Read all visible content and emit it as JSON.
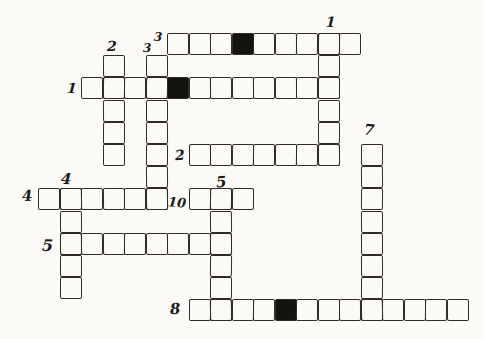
{
  "puzzle": {
    "paper_color": "#fbfaf7",
    "ink_color": "#2e2b28",
    "black_cell_color": "#141312",
    "label_color": "#1c1a17",
    "grid": {
      "origin_x": 38,
      "origin_y": 33,
      "cell_width": 21.5,
      "cell_height": 22.2,
      "columns": 20,
      "rows": 13
    },
    "words": [
      {
        "id": "3-across",
        "number": "3",
        "dir": "across",
        "row": 0,
        "col": 6,
        "len": 9,
        "black": [
          3
        ]
      },
      {
        "id": "1-across",
        "number": "1",
        "dir": "across",
        "row": 2,
        "col": 2,
        "len": 12,
        "black": [
          4
        ]
      },
      {
        "id": "2-across",
        "number": "2",
        "dir": "across",
        "row": 5,
        "col": 7,
        "len": 7,
        "black": []
      },
      {
        "id": "4-across",
        "number": "4",
        "dir": "across",
        "row": 7,
        "col": 0,
        "len": 6,
        "black": []
      },
      {
        "id": "10-across",
        "number": "10",
        "dir": "across",
        "row": 7,
        "col": 7,
        "len": 3,
        "black": []
      },
      {
        "id": "5-across",
        "number": "5",
        "dir": "across",
        "row": 9,
        "col": 1,
        "len": 8,
        "black": []
      },
      {
        "id": "8-across",
        "number": "8",
        "dir": "across",
        "row": 12,
        "col": 7,
        "len": 13,
        "black": [
          4
        ]
      },
      {
        "id": "1-down",
        "number": "1",
        "dir": "down",
        "row": 0,
        "col": 13,
        "len": 6,
        "black": []
      },
      {
        "id": "2-down",
        "number": "2",
        "dir": "down",
        "row": 1,
        "col": 3,
        "len": 5,
        "black": []
      },
      {
        "id": "3-down",
        "number": "3",
        "dir": "down",
        "row": 1,
        "col": 5,
        "len": 7,
        "black": []
      },
      {
        "id": "4-down",
        "number": "4",
        "dir": "down",
        "row": 7,
        "col": 1,
        "len": 5,
        "black": []
      },
      {
        "id": "5-down",
        "number": "5",
        "dir": "down",
        "row": 7,
        "col": 8,
        "len": 6,
        "black": []
      },
      {
        "id": "7-down",
        "number": "7",
        "dir": "down",
        "row": 5,
        "col": 15,
        "len": 8,
        "black": []
      }
    ],
    "labels": [
      {
        "for": "1-down",
        "text": "1",
        "x": 326,
        "y": 15,
        "size": 14
      },
      {
        "for": "2-down",
        "text": "2",
        "x": 107,
        "y": 39,
        "size": 14
      },
      {
        "for": "3-down",
        "text": "3",
        "x": 143,
        "y": 42,
        "size": 12
      },
      {
        "for": "3-across",
        "text": "3",
        "x": 154,
        "y": 31,
        "size": 12
      },
      {
        "for": "1-across",
        "text": "1",
        "x": 67,
        "y": 81,
        "size": 14
      },
      {
        "for": "2-across",
        "text": "2",
        "x": 175,
        "y": 148,
        "size": 14
      },
      {
        "for": "7-down",
        "text": "7",
        "x": 364,
        "y": 123,
        "size": 15
      },
      {
        "for": "4-down",
        "text": "4",
        "x": 61,
        "y": 172,
        "size": 15
      },
      {
        "for": "4-across",
        "text": "4",
        "x": 22,
        "y": 189,
        "size": 15
      },
      {
        "for": "5-down",
        "text": "5",
        "x": 216,
        "y": 175,
        "size": 15
      },
      {
        "for": "10-across",
        "text": "10",
        "x": 168,
        "y": 196,
        "size": 13
      },
      {
        "for": "5-across",
        "text": "5",
        "x": 42,
        "y": 238,
        "size": 16
      },
      {
        "for": "8-across",
        "text": "8",
        "x": 170,
        "y": 302,
        "size": 15
      }
    ]
  }
}
